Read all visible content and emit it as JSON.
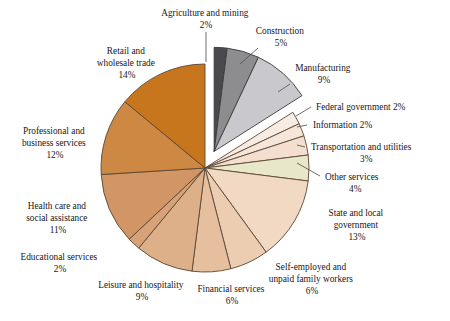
{
  "chart_data": {
    "type": "pie",
    "title": "",
    "subtitle": "",
    "xlabel": "",
    "ylabel": "",
    "legend_position": "labels-with-leader-lines",
    "grid": false,
    "units": "percent",
    "total": 100,
    "start_angle_deg": -90,
    "direction": "clockwise",
    "exploded_group": [
      "Agriculture and mining",
      "Construction",
      "Manufacturing"
    ],
    "categories": [
      "Agriculture and mining",
      "Construction",
      "Manufacturing",
      "Federal government",
      "Information",
      "Transportation and utilities",
      "Other services",
      "State and local government",
      "Self-employed and unpaid family workers",
      "Financial services",
      "Leisure and hospitality",
      "Educational services",
      "Health care and social assistance",
      "Professional and business services",
      "Retail and wholesale trade"
    ],
    "values": [
      2,
      5,
      9,
      2,
      2,
      3,
      4,
      13,
      6,
      6,
      9,
      2,
      11,
      12,
      14
    ],
    "colors": [
      "#4a4a4c",
      "#8d8d90",
      "#c9c9cd",
      "#f7ece3",
      "#f6e6da",
      "#f3ded0",
      "#e9e7c9",
      "#f2d9c4",
      "#eccdb2",
      "#e5bf9e",
      "#ddb089",
      "#d7a277",
      "#d29566",
      "#cd8844",
      "#c8761e"
    ],
    "slices": [
      {
        "label": "Agriculture and mining",
        "value": 2,
        "display": "2%",
        "color": "#4a4a4c",
        "exploded": true
      },
      {
        "label": "Construction",
        "value": 5,
        "display": "5%",
        "color": "#8d8d90",
        "exploded": true
      },
      {
        "label": "Manufacturing",
        "value": 9,
        "display": "9%",
        "color": "#c9c9cd",
        "exploded": true
      },
      {
        "label": "Federal government",
        "value": 2,
        "display": "2%",
        "color": "#f7ece3",
        "exploded": false
      },
      {
        "label": "Information",
        "value": 2,
        "display": "2%",
        "color": "#f6e6da",
        "exploded": false
      },
      {
        "label": "Transportation and utilities",
        "value": 3,
        "display": "3%",
        "color": "#f3ded0",
        "exploded": false
      },
      {
        "label": "Other services",
        "value": 4,
        "display": "4%",
        "color": "#e9e7c9",
        "exploded": false
      },
      {
        "label": "State and local government",
        "value": 13,
        "display": "13%",
        "color": "#f2d9c4",
        "exploded": false
      },
      {
        "label": "Self-employed and unpaid family workers",
        "value": 6,
        "display": "6%",
        "color": "#eccdb2",
        "exploded": false
      },
      {
        "label": "Financial services",
        "value": 6,
        "display": "6%",
        "color": "#e5bf9e",
        "exploded": false
      },
      {
        "label": "Leisure and hospitality",
        "value": 9,
        "display": "9%",
        "color": "#ddb089",
        "exploded": false
      },
      {
        "label": "Educational services",
        "value": 2,
        "display": "2%",
        "color": "#d7a277",
        "exploded": false
      },
      {
        "label": "Health care and social assistance",
        "value": 11,
        "display": "11%",
        "color": "#d29566",
        "exploded": false
      },
      {
        "label": "Professional and business services",
        "value": 12,
        "display": "12%",
        "color": "#cd8844",
        "exploded": false
      },
      {
        "label": "Retail and wholesale trade",
        "value": 14,
        "display": "14%",
        "color": "#c8761e",
        "exploded": false
      }
    ]
  },
  "labels": {
    "agriculture": {
      "line1": "Agriculture and mining",
      "line2": "2%"
    },
    "construction": {
      "line1": "Construction",
      "line2": "5%"
    },
    "manufacturing": {
      "line1": "Manufacturing",
      "line2": "9%"
    },
    "federal_government": {
      "line1": "Federal government 2%"
    },
    "information": {
      "line1": "Information 2%"
    },
    "transportation": {
      "line1": "Transportation and utilities",
      "line2": "3%"
    },
    "other_services": {
      "line1": "Other services",
      "line2": "4%"
    },
    "state_local": {
      "line1": "State and local",
      "line2": "government",
      "line3": "13%"
    },
    "self_employed": {
      "line1": "Self-employed and",
      "line2": "unpaid family workers",
      "line3": "6%"
    },
    "financial": {
      "line1": "Financial services",
      "line2": "6%"
    },
    "leisure": {
      "line1": "Leisure and hospitality",
      "line2": "9%"
    },
    "educational": {
      "line1": "Educational services",
      "line2": "2%"
    },
    "health_care": {
      "line1": "Health care and",
      "line2": "social assistance",
      "line3": "11%"
    },
    "professional": {
      "line1": "Professional and",
      "line2": "business services",
      "line3": "12%"
    },
    "retail": {
      "line1": "Retail and",
      "line2": "wholesale trade",
      "line3": "14%"
    }
  },
  "style": {
    "background": "#ffffff",
    "stroke": "#5b4632",
    "grey_stroke": "#3a3a3a",
    "leader_line": "#55524f",
    "text": "#17161a"
  }
}
